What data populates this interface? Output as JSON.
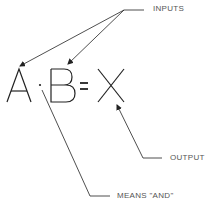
{
  "diagram": {
    "expression": {
      "a": "A",
      "dot": "·",
      "b": "B",
      "equals": "=",
      "x": "X"
    },
    "labels": {
      "inputs": "INPUTS",
      "output": "OUTPUT",
      "means_and": "MEANS \"AND\""
    },
    "colors": {
      "stroke": "#222222",
      "label": "#555555",
      "background": "#ffffff"
    }
  }
}
